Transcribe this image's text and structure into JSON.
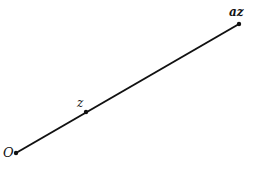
{
  "diagram": {
    "points": [
      {
        "id": "origin",
        "label": "O",
        "x": 16,
        "y": 153
      },
      {
        "id": "z",
        "label": "z",
        "x": 86,
        "y": 112
      },
      {
        "id": "az",
        "label": "az",
        "x": 239,
        "y": 24
      }
    ],
    "line": {
      "from": "origin",
      "to": "az",
      "color": "#111111"
    }
  }
}
